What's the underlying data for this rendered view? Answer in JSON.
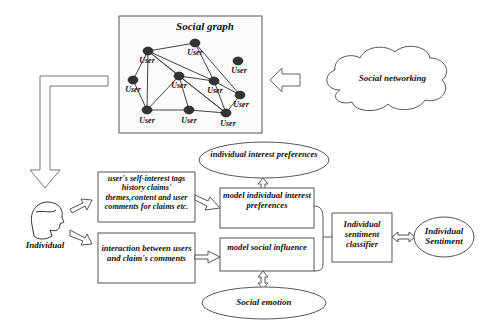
{
  "social_graph": {
    "title": "Social graph",
    "nodes": [
      {
        "label": "User",
        "x": 148,
        "y": 51
      },
      {
        "label": "User",
        "x": 195,
        "y": 43
      },
      {
        "label": "User",
        "x": 238,
        "y": 61
      },
      {
        "label": "User",
        "x": 133,
        "y": 80
      },
      {
        "label": "User",
        "x": 179,
        "y": 76
      },
      {
        "label": "User",
        "x": 214,
        "y": 81
      },
      {
        "label": "User",
        "x": 240,
        "y": 95
      },
      {
        "label": "User",
        "x": 147,
        "y": 110
      },
      {
        "label": "User",
        "x": 189,
        "y": 110
      },
      {
        "label": "User",
        "x": 226,
        "y": 113
      }
    ]
  },
  "cloud": {
    "label": "Social networking"
  },
  "individual": {
    "label": "Individual"
  },
  "input_box_1": {
    "text": "user's self-interest tags history claims' themes,content and user comments for claims etc."
  },
  "input_box_2": {
    "text": "interaction between users and claim's comments"
  },
  "ellipse_top": {
    "text": "individual interest preferences"
  },
  "model_box_1": {
    "text": "model individual interest preferences"
  },
  "model_box_2": {
    "text": "model social influence"
  },
  "ellipse_bottom": {
    "text": "Social emotion"
  },
  "classifier": {
    "text": "Individual sentiment classifier"
  },
  "output": {
    "text": "Individual Sentiment"
  }
}
